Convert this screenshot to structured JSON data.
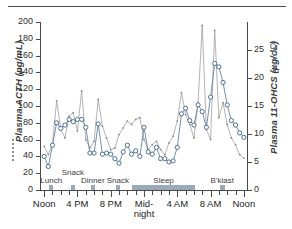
{
  "chart_data": {
    "type": "line",
    "title": "",
    "xlabel": "",
    "grid": false,
    "legend_position": "axis-titles",
    "x_ticks_major": [
      "Noon",
      "4 PM",
      "8 PM",
      "Mid-\nnight",
      "4 AM",
      "8 AM",
      "Noon"
    ],
    "x_tick_hours": [
      12,
      16,
      20,
      24,
      28,
      32,
      36
    ],
    "x_minor_step_hours": 1,
    "xlim_hours": [
      11.5,
      36.5
    ],
    "axes": [
      {
        "side": "left",
        "label": "Plasma ACTH (pg/mL)",
        "units": "pg/mL",
        "ylim": [
          0,
          200
        ],
        "ticks": [
          0,
          20,
          40,
          60,
          80,
          100,
          120,
          140,
          160,
          180,
          200
        ],
        "marker": "dotted-line",
        "color": "#8a8a8a"
      },
      {
        "side": "right",
        "label": "Plasma 11-OHCS (µg/dL)",
        "units": "µg/dL",
        "ylim": [
          0,
          30
        ],
        "ticks": [
          0,
          5,
          10,
          15,
          20,
          25
        ],
        "marker": "open-circle-dotted-line",
        "color": "#3f6285"
      }
    ],
    "series": [
      {
        "name": "Plasma ACTH (pg/mL)",
        "axis": "left",
        "color": "#8a8a8a",
        "marker": "small-dot",
        "x": [
          12.0,
          12.5,
          13.0,
          13.5,
          14.0,
          14.5,
          15.0,
          15.5,
          16.0,
          16.5,
          17.0,
          17.5,
          18.0,
          18.5,
          19.0,
          19.5,
          20.0,
          20.5,
          21.0,
          21.5,
          22.0,
          22.5,
          23.0,
          23.5,
          24.0,
          24.5,
          25.0,
          25.5,
          26.0,
          26.5,
          27.0,
          27.5,
          28.0,
          28.5,
          29.0,
          29.5,
          30.0,
          30.5,
          31.0,
          31.5,
          32.0,
          32.5,
          33.0,
          33.5,
          34.0,
          34.5,
          35.0,
          35.5,
          36.0
        ],
        "values": [
          52,
          42,
          55,
          106,
          72,
          62,
          88,
          92,
          70,
          118,
          60,
          50,
          58,
          108,
          76,
          62,
          48,
          50,
          66,
          74,
          82,
          78,
          84,
          86,
          60,
          48,
          54,
          58,
          48,
          42,
          56,
          64,
          82,
          116,
          90,
          78,
          62,
          104,
          196,
          72,
          60,
          190,
          86,
          104,
          78,
          62,
          54,
          42,
          38
        ]
      },
      {
        "name": "Plasma 11-OHCS (µg/dL)",
        "axis": "right",
        "color": "#3f6285",
        "marker": "open-circle",
        "x": [
          12.0,
          12.5,
          13.0,
          13.5,
          14.0,
          14.5,
          15.0,
          15.5,
          16.0,
          16.5,
          17.0,
          17.5,
          18.0,
          18.5,
          19.0,
          19.5,
          20.0,
          20.5,
          21.0,
          21.5,
          22.0,
          22.5,
          23.0,
          23.5,
          24.0,
          24.5,
          25.0,
          25.5,
          26.0,
          26.5,
          27.0,
          27.5,
          28.0,
          28.5,
          29.0,
          29.5,
          30.0,
          30.5,
          31.0,
          31.5,
          32.0,
          32.5,
          33.0,
          33.5,
          34.0,
          34.5,
          35.0,
          35.5,
          36.0
        ],
        "values": [
          6.0,
          4.2,
          8.0,
          12.0,
          11.0,
          11.6,
          12.6,
          12.2,
          12.6,
          12.6,
          11.2,
          6.6,
          6.6,
          11.8,
          6.4,
          6.6,
          6.4,
          5.6,
          4.8,
          6.8,
          8.0,
          6.4,
          7.0,
          6.0,
          11.2,
          6.8,
          6.4,
          7.6,
          5.6,
          5.6,
          5.0,
          5.2,
          7.6,
          13.6,
          14.6,
          12.4,
          11.6,
          15.2,
          14.0,
          11.2,
          16.6,
          22.6,
          22.0,
          19.2,
          15.2,
          12.4,
          11.6,
          10.2,
          9.4
        ]
      }
    ],
    "activities": [
      {
        "label": "Lunch",
        "start_hour": 12.6,
        "end_hour": 13.1
      },
      {
        "label": "Snack",
        "start_hour": 15.2,
        "end_hour": 15.7
      },
      {
        "label": "Dinner",
        "start_hour": 17.6,
        "end_hour": 18.1
      },
      {
        "label": "Snack",
        "start_hour": 20.6,
        "end_hour": 21.1
      },
      {
        "label": "Sleep",
        "start_hour": 22.6,
        "end_hour": 30.1
      },
      {
        "label": "B'klast",
        "start_hour": 33.1,
        "end_hour": 33.7
      }
    ]
  }
}
